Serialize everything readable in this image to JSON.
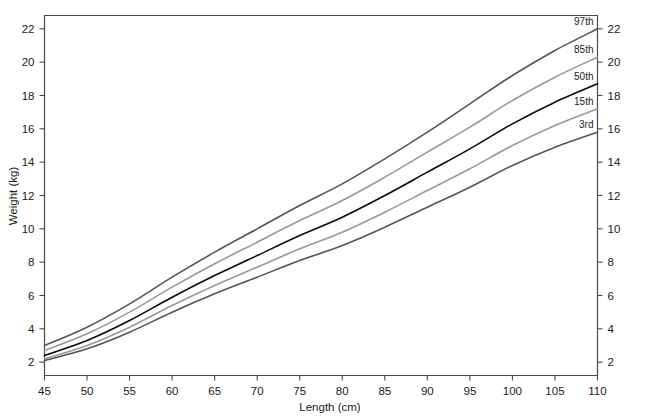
{
  "chart_data": {
    "type": "line",
    "title": "",
    "xlabel": "Length (cm)",
    "ylabel": "Weight (kg)",
    "xlim": [
      45,
      110
    ],
    "ylim": [
      1.2,
      22.8
    ],
    "xticks": [
      45,
      50,
      55,
      60,
      65,
      70,
      75,
      80,
      85,
      90,
      95,
      100,
      105,
      110
    ],
    "yticks": [
      2,
      4,
      6,
      8,
      10,
      12,
      14,
      16,
      18,
      20,
      22
    ],
    "yticks_right": [
      2,
      4,
      6,
      8,
      10,
      12,
      14,
      16,
      18,
      20,
      22
    ],
    "grid": false,
    "legend_position": "right-inline-labels",
    "x": [
      45,
      50,
      55,
      60,
      65,
      70,
      75,
      80,
      85,
      90,
      95,
      100,
      105,
      110
    ],
    "series": [
      {
        "name": "97th",
        "label": "97th",
        "color": "#555555",
        "values": [
          3.0,
          4.1,
          5.5,
          7.1,
          8.6,
          10.0,
          11.4,
          12.7,
          14.2,
          15.8,
          17.5,
          19.2,
          20.7,
          22.0
        ]
      },
      {
        "name": "85th",
        "label": "85th",
        "color": "#999999",
        "values": [
          2.7,
          3.7,
          5.0,
          6.5,
          7.9,
          9.2,
          10.5,
          11.7,
          13.1,
          14.6,
          16.1,
          17.7,
          19.1,
          20.3
        ]
      },
      {
        "name": "50th",
        "label": "50th",
        "color": "#0a0a0a",
        "values": [
          2.4,
          3.3,
          4.5,
          5.9,
          7.2,
          8.4,
          9.6,
          10.7,
          12.0,
          13.4,
          14.8,
          16.3,
          17.6,
          18.7
        ]
      },
      {
        "name": "15th",
        "label": "15th",
        "color": "#999999",
        "values": [
          2.2,
          3.0,
          4.1,
          5.4,
          6.6,
          7.7,
          8.8,
          9.8,
          11.0,
          12.3,
          13.6,
          15.0,
          16.2,
          17.2
        ]
      },
      {
        "name": "3rd",
        "label": "3rd",
        "color": "#555555",
        "values": [
          2.1,
          2.8,
          3.8,
          5.0,
          6.1,
          7.1,
          8.1,
          9.0,
          10.1,
          11.3,
          12.5,
          13.8,
          14.9,
          15.8
        ]
      }
    ]
  },
  "axes": {
    "x_axis_title": "Length (cm)",
    "y_axis_title": "Weight (kg)"
  }
}
